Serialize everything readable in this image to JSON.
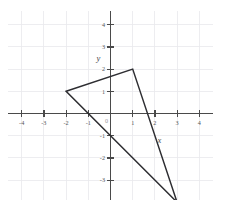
{
  "figure": {
    "background_color": "#ffffff"
  },
  "chart_data": {
    "type": "scatter",
    "title": "",
    "xlabel": "x",
    "ylabel": "y",
    "xlim": [
      -4.6,
      4.6
    ],
    "ylim": [
      -4.6,
      4.6
    ],
    "grid": true,
    "legend": "none",
    "axis_color": "#4a4a4a",
    "grid_color": "#e9e9ec",
    "shape_color": "#2d2d31",
    "x_ticks": [
      -4,
      -3,
      -2,
      -1,
      1,
      2,
      3,
      4
    ],
    "y_ticks": [
      4,
      3,
      2,
      1,
      -1,
      -2,
      -3,
      -4
    ],
    "x_tick_labels": [
      "-4",
      "-3",
      "-2",
      "-1",
      "1",
      "2",
      "3",
      "4"
    ],
    "y_tick_labels": [
      "4",
      "3",
      "2",
      "1",
      "-1",
      "-2",
      "-3",
      "-4"
    ],
    "origin_label": "0",
    "grid_x_lines": [
      -4,
      -3,
      -2,
      -1,
      0,
      1,
      2,
      3,
      4
    ],
    "grid_y_lines": [
      -4,
      -3,
      -2,
      -1,
      0,
      1,
      2,
      3,
      4
    ],
    "series": [
      {
        "name": "triangle",
        "kind": "polygon",
        "closed": true,
        "points": [
          {
            "x": -2,
            "y": 1,
            "label": "vertex-a"
          },
          {
            "x": 1,
            "y": 2,
            "label": "vertex-b"
          },
          {
            "x": 3,
            "y": -4,
            "label": "vertex-c"
          }
        ]
      }
    ],
    "annotations": [
      {
        "text": "y",
        "x": -0.55,
        "y": 2.35,
        "style": "italic",
        "name": "y-axis-name"
      },
      {
        "text": "x",
        "x": 2.2,
        "y": -1.35,
        "style": "italic",
        "name": "x-axis-name"
      }
    ]
  }
}
